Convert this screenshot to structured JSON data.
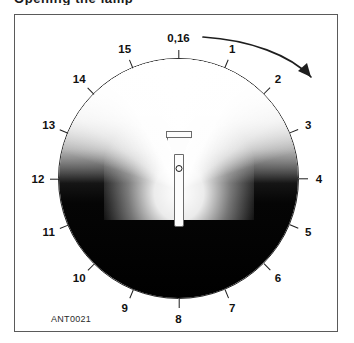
{
  "header": {
    "clipped_title": "Opening the lamp"
  },
  "figure": {
    "id_label": "ANT0021",
    "caption": ""
  },
  "dial": {
    "center_top_label": "0,16",
    "position_labels": [
      {
        "value": "0,16",
        "index": 0
      },
      {
        "value": "1",
        "index": 1
      },
      {
        "value": "2",
        "index": 2
      },
      {
        "value": "3",
        "index": 3
      },
      {
        "value": "4",
        "index": 4
      },
      {
        "value": "5",
        "index": 5
      },
      {
        "value": "6",
        "index": 6
      },
      {
        "value": "7",
        "index": 7
      },
      {
        "value": "8",
        "index": 8
      },
      {
        "value": "9",
        "index": 9
      },
      {
        "value": "10",
        "index": 10
      },
      {
        "value": "11",
        "index": 11
      },
      {
        "value": "12",
        "index": 12
      },
      {
        "value": "13",
        "index": 13
      },
      {
        "value": "14",
        "index": 14
      },
      {
        "value": "15",
        "index": 15
      }
    ],
    "tick_count": 16,
    "rotation_direction": "clockwise"
  },
  "device": {
    "name": "flashlight",
    "beam_direction": "up",
    "switch": "power-switch"
  },
  "colors": {
    "frame_border": "#5a5a5a",
    "dial_border": "#2a2a2a",
    "dark_field": "#000000",
    "light_beam": "#ffffff",
    "label_text": "#111111"
  }
}
